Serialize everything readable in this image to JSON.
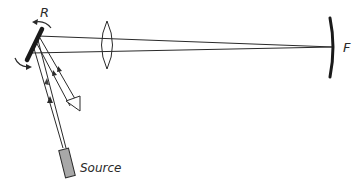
{
  "diagram": {
    "type": "optical-setup",
    "labels": {
      "rotating_mirror": "R",
      "focal_mirror": "F",
      "source": "Source"
    },
    "components": [
      {
        "id": "rotating-mirror",
        "label": "R",
        "kind": "plane mirror (rotating)"
      },
      {
        "id": "lens",
        "label": "",
        "kind": "biconvex lens"
      },
      {
        "id": "fixed-mirror",
        "label": "F",
        "kind": "concave mirror"
      },
      {
        "id": "source",
        "label": "Source",
        "kind": "light source"
      }
    ],
    "colors": {
      "line": "#2a2a2a",
      "source_fill": "#a8a8a8",
      "background": "#ffffff"
    }
  }
}
